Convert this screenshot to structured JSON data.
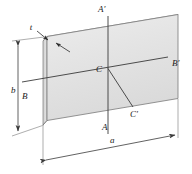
{
  "figure": {
    "name": "rectangular-plate-axes-diagram",
    "labels": {
      "thickness": "t",
      "height": "b",
      "width": "a",
      "axis_a_top": "A′",
      "axis_a_bottom": "A",
      "axis_b_left": "B",
      "axis_b_right": "B′",
      "center": "C",
      "axis_c_prime": "C′"
    },
    "colors": {
      "plate_face": "#e3e3e3",
      "plate_face_light": "#efefef",
      "plate_edge_side": "#d2d2d2",
      "outline": "#6e6e6e",
      "axis_line": "#3a3a3a",
      "dimension_line": "#555555",
      "text": "#1a1a1a",
      "background": "#ffffff"
    }
  }
}
